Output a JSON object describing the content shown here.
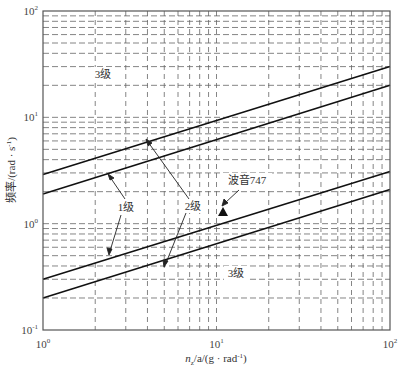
{
  "chart_data": {
    "type": "line",
    "title": "",
    "xlabel": "n_z/a/(g · rad⁻¹)",
    "ylabel": "频率/(rad · s⁻¹)",
    "xscale": "log",
    "yscale": "log",
    "xlim": [
      1,
      100
    ],
    "ylim": [
      0.1,
      100
    ],
    "grid": true,
    "grid_style": "dashed",
    "x_ticks": [
      {
        "base": "10",
        "exp": "0",
        "value": 1
      },
      {
        "base": "10",
        "exp": "1",
        "value": 10
      },
      {
        "base": "10",
        "exp": "2",
        "value": 100
      }
    ],
    "y_ticks": [
      {
        "base": "10",
        "exp": "-1",
        "value": 0.1
      },
      {
        "base": "10",
        "exp": "0",
        "value": 1
      },
      {
        "base": "10",
        "exp": "1",
        "value": 10
      },
      {
        "base": "10",
        "exp": "2",
        "value": 100
      }
    ],
    "series": [
      {
        "name": "boundary-3-2-upper",
        "x": [
          1,
          100
        ],
        "y": [
          2.9,
          30
        ]
      },
      {
        "name": "boundary-2-1-upper",
        "x": [
          1,
          100
        ],
        "y": [
          1.9,
          20
        ]
      },
      {
        "name": "boundary-1-2-lower",
        "x": [
          1,
          100
        ],
        "y": [
          0.3,
          3.1
        ]
      },
      {
        "name": "boundary-2-3-lower",
        "x": [
          1,
          100
        ],
        "y": [
          0.2,
          2.1
        ]
      }
    ],
    "annotations": [
      {
        "text": "3级",
        "x": 2.3,
        "y": 13.5
      },
      {
        "text": "1级",
        "x": 2.6,
        "y": 1.5
      },
      {
        "text": "2级",
        "x": 5.0,
        "y": 1.5
      },
      {
        "text": "3级",
        "x": 13.0,
        "y": 0.38
      },
      {
        "text": "波音747",
        "x": 13.5,
        "y": 2.1
      },
      {
        "text": "▲",
        "marker": "Boeing 747 point",
        "x": 7.5,
        "y": 1.1
      }
    ]
  },
  "labels": {
    "ylabel": "频率/(rad · s",
    "ylabel_sup": "-1",
    "ylabel_end": ")",
    "xlabel_n": "n",
    "xlabel_sub": "z",
    "xlabel_rest": "/a/(g · rad",
    "xlabel_sup": "-1",
    "xlabel_end": ")",
    "level3_top": "3级",
    "level1": "1级",
    "level2": "2级",
    "level3_bottom": "3级",
    "boeing": "波音747"
  }
}
